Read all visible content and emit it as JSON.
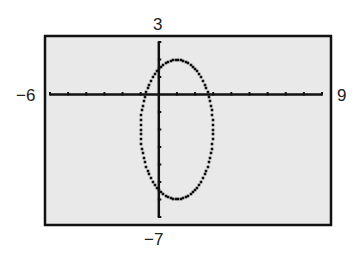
{
  "chart_data": {
    "type": "line",
    "title": "",
    "xlabel": "",
    "ylabel": "",
    "xlim": [
      -6,
      9
    ],
    "ylim": [
      -7,
      3
    ],
    "xscale": 1,
    "yscale": 1,
    "grid": false,
    "window_labels": {
      "xmin": "−6",
      "xmax": "9",
      "ymin": "−7",
      "ymax": "3"
    },
    "series": [
      {
        "name": "ellipse",
        "shape": "ellipse",
        "center": [
          1,
          -2
        ],
        "semi_axis_x": 2,
        "semi_axis_y": 4,
        "equation": "(x-1)^2/4 + (y+2)^2/16 = 1"
      }
    ],
    "colors": {
      "background": "#e9e9e9",
      "axis": "#111111",
      "curve": "#111111",
      "frame": "#111111"
    }
  }
}
